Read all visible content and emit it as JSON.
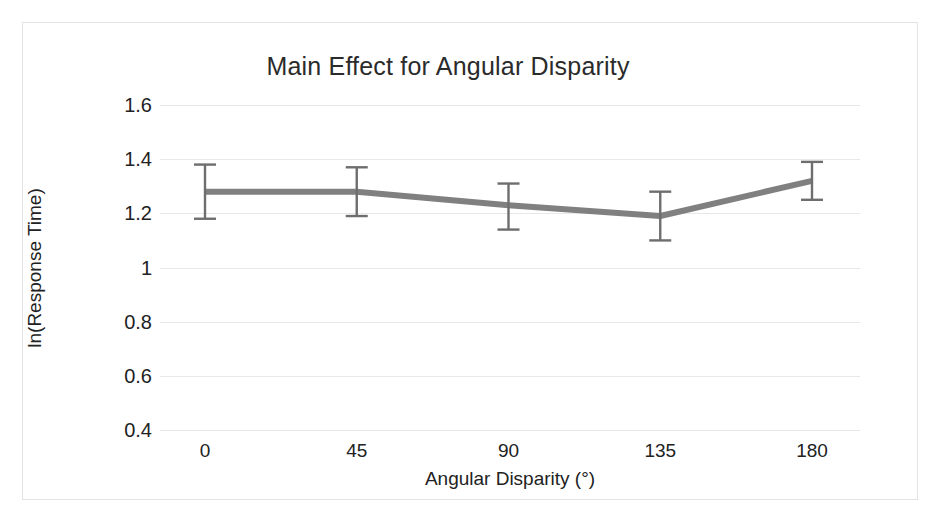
{
  "figure": {
    "background_color": "#ffffff",
    "frame_color": "#e3e3e3"
  },
  "chart_data": {
    "type": "line",
    "title": "Main Effect for Angular Disparity",
    "xlabel": "Angular Disparity (°)",
    "ylabel": "ln(Response Time)",
    "categories": [
      "0",
      "45",
      "90",
      "135",
      "180"
    ],
    "x": [
      0,
      45,
      90,
      135,
      180
    ],
    "values": [
      1.28,
      1.28,
      1.23,
      1.19,
      1.32
    ],
    "error_upper": [
      1.38,
      1.37,
      1.31,
      1.28,
      1.39
    ],
    "error_lower": [
      1.18,
      1.19,
      1.14,
      1.1,
      1.25
    ],
    "error_plus": [
      0.1,
      0.09,
      0.08,
      0.09,
      0.07
    ],
    "error_minus": [
      0.1,
      0.09,
      0.09,
      0.09,
      0.07
    ],
    "ylim": [
      0.4,
      1.6
    ],
    "xlim": [
      0,
      180
    ],
    "ytick_labels": [
      "1.6",
      "1.4",
      "1.2",
      "1",
      "0.8",
      "0.6",
      "0.4"
    ],
    "ytick_values": [
      1.6,
      1.4,
      1.2,
      1.0,
      0.8,
      0.6,
      0.4
    ],
    "xtick_labels": [
      "0",
      "45",
      "90",
      "135",
      "180"
    ],
    "grid": "horizontal",
    "grid_color": "#e8e8e8",
    "legend": "none",
    "series": [
      {
        "name": "Mean ln(Response Time)",
        "color": "#808080",
        "line_width": 6,
        "marker": "none",
        "values": [
          1.28,
          1.28,
          1.23,
          1.19,
          1.32
        ]
      }
    ],
    "error_bar_color": "#6e6e6e",
    "error_bar_cap_width": 22
  }
}
